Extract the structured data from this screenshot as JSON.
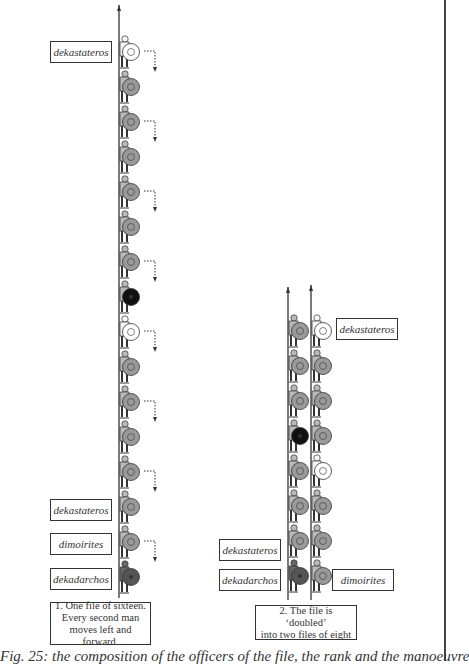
{
  "diagram": {
    "type": "military formation diagram",
    "colors": {
      "soldier_fill": "#b8b8b8",
      "shield_grey": "#9a9a9a",
      "shield_white": "#ffffff",
      "shield_black": "#111111",
      "shield_dark": "#555555",
      "line": "#333333"
    },
    "panel1": {
      "labels": {
        "top": "dekastateros",
        "bottom_1": "dekastateros",
        "bottom_2": "dimoirites",
        "bottom_3": "dekadarchos"
      },
      "caption": [
        "1. One file of sixteen.",
        "Every second man",
        "moves left and forward."
      ],
      "file": [
        "white",
        "grey",
        "grey",
        "grey",
        "grey",
        "grey",
        "grey",
        "black",
        "white",
        "grey",
        "grey",
        "grey",
        "grey",
        "grey",
        "grey",
        "dark"
      ],
      "arrows_on_positions": [
        1,
        3,
        5,
        7,
        9,
        11,
        13,
        15
      ]
    },
    "panel2": {
      "labels": {
        "top_right": "dekastateros",
        "bottom_left_1": "dekastateros",
        "bottom_left_2": "dekadarchos",
        "bottom_right": "dimoirites"
      },
      "caption": [
        "2. The file is ‘doubled’",
        "into two files of eight"
      ],
      "left_file": [
        "grey",
        "grey",
        "grey",
        "black",
        "grey",
        "grey",
        "grey",
        "dark"
      ],
      "right_file": [
        "white",
        "grey",
        "grey",
        "grey",
        "white",
        "grey",
        "grey",
        "grey"
      ]
    },
    "figure_caption": "Fig. 25: the composition of the officers of the file, the rank and the manoeuvre"
  }
}
